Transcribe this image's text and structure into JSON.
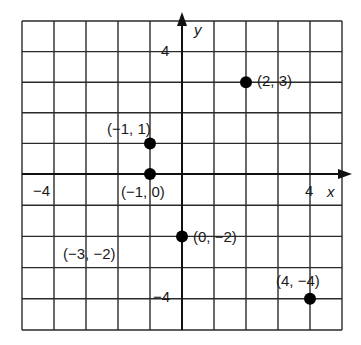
{
  "diagram": {
    "type": "coordinate-plane",
    "x_axis_label": "x",
    "y_axis_label": "y",
    "x_range": [
      -5,
      5
    ],
    "y_range": [
      -5,
      5
    ],
    "grid": true,
    "tick_labels": {
      "x_pos": "4",
      "x_neg": "−4",
      "y_pos": "4",
      "y_neg": "−4"
    },
    "points": [
      {
        "x": 2,
        "y": 3,
        "label": "(2, 3)",
        "plotted": true
      },
      {
        "x": -1,
        "y": 1,
        "label": "(−1, 1)",
        "plotted": true
      },
      {
        "x": -1,
        "y": 0,
        "label": "(−1, 0)",
        "plotted": true
      },
      {
        "x": 0,
        "y": -2,
        "label": "(0, −2)",
        "plotted": true
      },
      {
        "x": 4,
        "y": -4,
        "label": "(4, −4)",
        "plotted": true
      },
      {
        "x": -3,
        "y": -2,
        "label": "(−3, −2)",
        "plotted": false
      }
    ],
    "colors": {
      "grid": "#2a2a2a",
      "point": "#000000",
      "text": "#1a1a1a"
    }
  }
}
